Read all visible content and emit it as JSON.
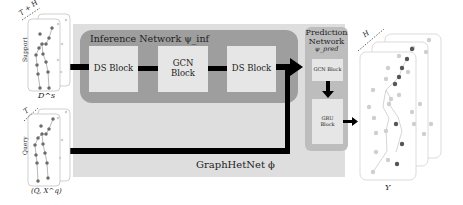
{
  "diagram": {
    "support": {
      "label": "Support",
      "sequence_label": "T + H",
      "caption": "D^s"
    },
    "query": {
      "label": "Query",
      "sequence_label": "T",
      "caption": "(Q, X^q)"
    },
    "inference_network": {
      "title": "Inference Network ψ_inf",
      "blocks": [
        {
          "label": "DS Block"
        },
        {
          "label": "GCN Block"
        },
        {
          "label": "DS Block"
        }
      ]
    },
    "prediction_network": {
      "title_line1": "Prediction",
      "title_line2": "Network",
      "subscript": "ψ_pred",
      "blocks": [
        {
          "label": "GCN Block"
        },
        {
          "label": "GRU Block"
        }
      ]
    },
    "model_caption": "GraphHetNet ϕ",
    "output": {
      "sequence_label": "H",
      "caption": "Y"
    },
    "colors": {
      "outer_background": "#dedede",
      "inference_background": "#9e9e9e",
      "prediction_background": "#bdbdbd",
      "block_background": "#e6e6e6",
      "arrow": "#000000",
      "joint_dark": "#555555",
      "joint_light": "#cfcfcf"
    }
  }
}
